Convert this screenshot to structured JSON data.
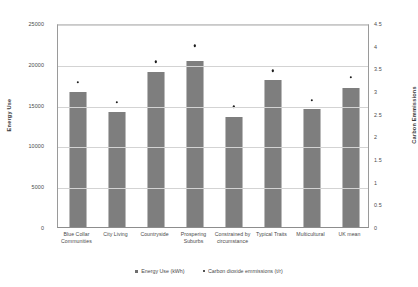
{
  "chart_data": {
    "type": "bar",
    "title": "",
    "subtitle": "",
    "xlabel": "",
    "ylabel": "Energy Use",
    "y2label": "Carbon Emmissions",
    "ylim": [
      0,
      25000
    ],
    "y2lim": [
      0,
      4.5
    ],
    "grid": true,
    "legend_position": "bottom",
    "categories": [
      "Blue Collar Communities",
      "City Living",
      "Countryside",
      "Prospering Suburbs",
      "Constrained by circumstance",
      "Typical Traits",
      "Multicultural",
      "UK mean"
    ],
    "y_ticks": [
      "0",
      "5000",
      "10000",
      "15000",
      "20000",
      "25000"
    ],
    "y2_ticks": [
      "0",
      "0.5",
      "1",
      "1.5",
      "2",
      "2.5",
      "3",
      "3.5",
      "4",
      "4.5"
    ],
    "series": [
      {
        "name": "Energy Use (kWh)",
        "axis": "left",
        "marker": "square",
        "color": "#6e6e6e",
        "values": [
          16500,
          14100,
          19000,
          20400,
          13500,
          18000,
          14500,
          17000
        ]
      },
      {
        "name": "Carbon dioxide emmissions (t/r)",
        "axis": "right",
        "marker": "dot",
        "color": "#1d1d1d",
        "values": [
          3.2,
          2.75,
          3.65,
          4.0,
          2.65,
          3.45,
          2.8,
          3.3
        ]
      }
    ]
  }
}
